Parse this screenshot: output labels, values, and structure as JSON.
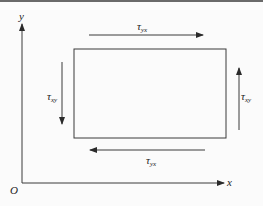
{
  "diagram": {
    "type": "shear-stress-element",
    "axes": {
      "x_label": "x",
      "y_label": "y",
      "origin_label": "O"
    },
    "stresses": [
      {
        "id": "top",
        "symbol": "τ",
        "subscript": "yx",
        "direction": "right"
      },
      {
        "id": "bottom",
        "symbol": "τ",
        "subscript": "yx",
        "direction": "left"
      },
      {
        "id": "left",
        "symbol": "τ",
        "subscript": "xy",
        "direction": "down"
      },
      {
        "id": "right",
        "symbol": "τ",
        "subscript": "xy",
        "direction": "up"
      }
    ],
    "colors": {
      "line": "#3a3a3a",
      "text": "#222222",
      "border": "#6a6a6a",
      "background": "#fbfbfb"
    }
  }
}
